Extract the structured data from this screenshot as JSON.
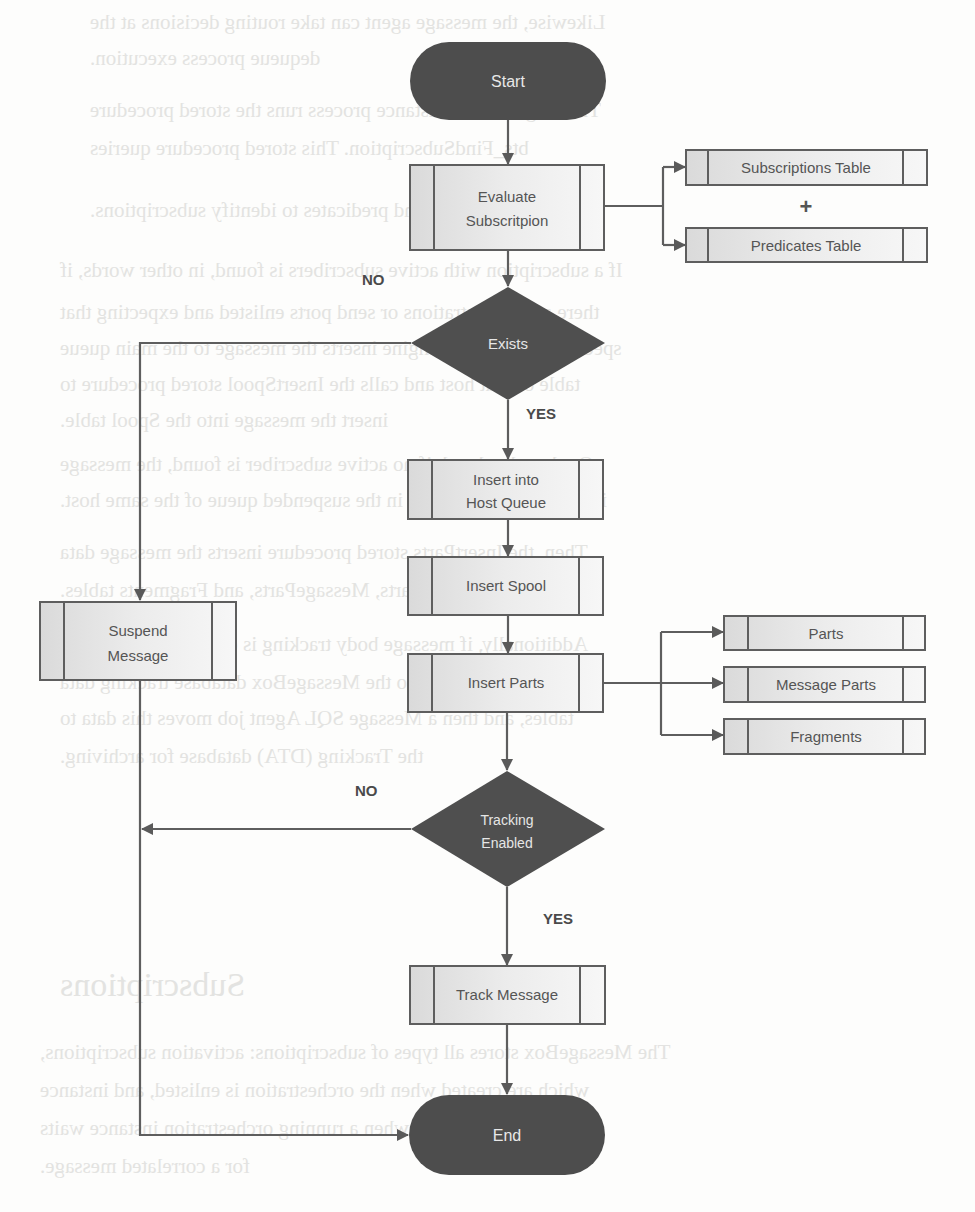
{
  "diagram": {
    "type": "flowchart",
    "colors": {
      "terminal_fill": "#4d4d4d",
      "decision_fill": "#4f4f4f",
      "process_fill_left": "#dcdcdc",
      "process_fill_right": "#f4f4f4",
      "stroke": "#5a5a5a",
      "text_dark": "#555555",
      "text_light": "#e8e8e8"
    },
    "nodes": {
      "start": {
        "label": "Start",
        "shape": "terminal"
      },
      "evaluate": {
        "label_line1": "Evaluate",
        "label_line2": "Subscritpion",
        "shape": "predefined-process"
      },
      "subscriptions_table": {
        "label": "Subscriptions Table",
        "shape": "predefined-process"
      },
      "plus": {
        "label": "+"
      },
      "predicates_table": {
        "label": "Predicates Table",
        "shape": "predefined-process"
      },
      "exists": {
        "label": "Exists",
        "shape": "decision"
      },
      "insert_host_queue": {
        "label_line1": "Insert into",
        "label_line2": "Host Queue",
        "shape": "predefined-process"
      },
      "insert_spool": {
        "label": "Insert Spool",
        "shape": "predefined-process"
      },
      "insert_parts": {
        "label": "Insert Parts",
        "shape": "predefined-process"
      },
      "parts": {
        "label": "Parts",
        "shape": "predefined-process"
      },
      "message_parts": {
        "label": "Message Parts",
        "shape": "predefined-process"
      },
      "fragments": {
        "label": "Fragments",
        "shape": "predefined-process"
      },
      "suspend": {
        "label_line1": "Suspend",
        "label_line2": "Message",
        "shape": "predefined-process"
      },
      "tracking": {
        "label_line1": "Tracking",
        "label_line2": "Enabled",
        "shape": "decision"
      },
      "track_message": {
        "label": "Track Message",
        "shape": "predefined-process"
      },
      "end": {
        "label": "End",
        "shape": "terminal"
      }
    },
    "edge_labels": {
      "exists_no": "NO",
      "exists_yes": "YES",
      "tracking_no": "NO",
      "tracking_yes": "YES"
    },
    "edges": [
      {
        "from": "Start",
        "to": "Evaluate Subscritpion"
      },
      {
        "from": "Evaluate Subscritpion",
        "to": "Subscriptions Table"
      },
      {
        "from": "Evaluate Subscritpion",
        "to": "Predicates Table"
      },
      {
        "from": "Evaluate Subscritpion",
        "to": "Exists"
      },
      {
        "from": "Exists",
        "to": "Suspend Message",
        "label": "NO"
      },
      {
        "from": "Exists",
        "to": "Insert into Host Queue",
        "label": "YES"
      },
      {
        "from": "Insert into Host Queue",
        "to": "Insert Spool"
      },
      {
        "from": "Insert Spool",
        "to": "Insert Parts"
      },
      {
        "from": "Insert Parts",
        "to": "Parts"
      },
      {
        "from": "Insert Parts",
        "to": "Message Parts"
      },
      {
        "from": "Insert Parts",
        "to": "Fragments"
      },
      {
        "from": "Insert Parts",
        "to": "Tracking Enabled"
      },
      {
        "from": "Tracking Enabled",
        "to": "End",
        "label": "NO"
      },
      {
        "from": "Tracking Enabled",
        "to": "Track Message",
        "label": "YES"
      },
      {
        "from": "Track Message",
        "to": "End"
      },
      {
        "from": "Suspend Message",
        "to": "End"
      }
    ]
  },
  "background_bleed": {
    "lines": [
      "Likewise, the message agent can take routing decisions at the",
      "dequeue process execution.",
      "The MsgBox host instance process runs the stored procedure",
      "bts_FindSubscription. This stored procedure queries",
      "subscriptions and predicates to identify subscriptions.",
      "If a subscription with active subscribers is found, in other words, if",
      "there are orchestrations or send ports enlisted and expecting that",
      "specific message, the engine inserts the message to the main queue",
      "table of that host and calls the InsertSpool stored procedure to",
      "insert the message into the Spool table.",
      "On the other hand, if no active subscriber is found, the message",
      "is suspended and stored in the suspended queue of the same host.",
      "Then, the InsertParts stored procedure inserts the message data",
      "into the Parts, MessageParts, and Fragments tables.",
      "Additionally, if message body tracking is enabled, the message",
      "is moved into the MessageBox database tracking data",
      "tables, and then a Message SQL Agent job moves this data to",
      "the Tracking (DTA) database for archiving.",
      "Subscriptions",
      "The MessageBox stores all types of subscriptions: activation subscriptions,",
      "which are created when the orchestration is enlisted, and instance",
      "subscriptions, created when a running orchestration instance waits",
      "for a correlated message."
    ]
  }
}
